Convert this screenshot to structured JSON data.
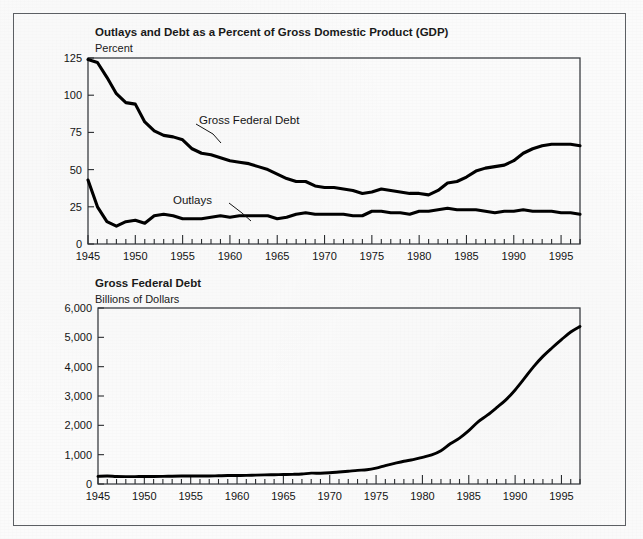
{
  "figure": {
    "background_color": "#fbfbfb",
    "frame_color": "#5c5f63",
    "line_color": "#000000"
  },
  "top_chart": {
    "title": "Outlays and Debt as a Percent of Gross Domestic Product (GDP)",
    "subtitle": "Percent",
    "label_debt": "Gross Federal Debt",
    "label_outlays": "Outlays"
  },
  "bottom_chart": {
    "title": "Gross Federal Debt",
    "subtitle": "Billions of Dollars"
  },
  "chart_data": [
    {
      "id": "outlays-and-debt-percent-gdp",
      "type": "line",
      "title": "Outlays and Debt as a Percent of Gross Domestic Product (GDP)",
      "xlabel": "",
      "ylabel": "Percent",
      "xlim": [
        1945,
        1997
      ],
      "ylim": [
        0,
        125
      ],
      "yticks": [
        0,
        25,
        50,
        75,
        100,
        125
      ],
      "ytick_labels": [
        "0",
        "25",
        "50",
        "75",
        "100",
        "125"
      ],
      "xticks": [
        1945,
        1950,
        1955,
        1960,
        1965,
        1970,
        1975,
        1980,
        1985,
        1990,
        1995
      ],
      "xtick_labels": [
        "1945",
        "1950",
        "1955",
        "1960",
        "1965",
        "1970",
        "1975",
        "1980",
        "1985",
        "1990",
        "1995"
      ],
      "minor_xtick_interval": 1,
      "grid": false,
      "legend": "inline-annotations",
      "annotations": [
        {
          "text": "Gross Federal Debt",
          "x": 1958.5,
          "y": 92
        },
        {
          "text": "Outlays",
          "x": 1955.5,
          "y": 32
        }
      ],
      "x": [
        1945,
        1946,
        1947,
        1948,
        1949,
        1950,
        1951,
        1952,
        1953,
        1954,
        1955,
        1956,
        1957,
        1958,
        1959,
        1960,
        1961,
        1962,
        1963,
        1964,
        1965,
        1966,
        1967,
        1968,
        1969,
        1970,
        1971,
        1972,
        1973,
        1974,
        1975,
        1976,
        1977,
        1978,
        1979,
        1980,
        1981,
        1982,
        1983,
        1984,
        1985,
        1986,
        1987,
        1988,
        1989,
        1990,
        1991,
        1992,
        1993,
        1994,
        1995,
        1996,
        1997
      ],
      "series": [
        {
          "name": "Gross Federal Debt",
          "values": [
            124,
            122,
            112,
            101,
            95,
            94,
            82,
            76,
            73,
            72,
            70,
            64,
            61,
            60,
            58,
            56,
            55,
            54,
            52,
            50,
            47,
            44,
            42,
            42,
            39,
            38,
            38,
            37,
            36,
            34,
            35,
            37,
            36,
            35,
            34,
            34,
            33,
            36,
            41,
            42,
            45,
            49,
            51,
            52,
            53,
            56,
            61,
            64,
            66,
            67,
            67,
            67,
            66
          ]
        },
        {
          "name": "Outlays",
          "values": [
            43,
            25,
            15,
            12,
            15,
            16,
            14,
            19,
            20,
            19,
            17,
            17,
            17,
            18,
            19,
            18,
            19,
            19,
            19,
            19,
            17,
            18,
            20,
            21,
            20,
            20,
            20,
            20,
            19,
            19,
            22,
            22,
            21,
            21,
            20,
            22,
            22,
            23,
            24,
            23,
            23,
            23,
            22,
            21,
            22,
            22,
            23,
            22,
            22,
            22,
            21,
            21,
            20
          ]
        }
      ]
    },
    {
      "id": "gross-federal-debt-billions",
      "type": "line",
      "title": "Gross Federal Debt",
      "xlabel": "",
      "ylabel": "Billions of Dollars",
      "xlim": [
        1945,
        1997
      ],
      "ylim": [
        0,
        6000
      ],
      "yticks": [
        0,
        1000,
        2000,
        3000,
        4000,
        5000,
        6000
      ],
      "ytick_labels": [
        "0",
        "1,000",
        "2,000",
        "3,000",
        "4,000",
        "5,000",
        "6,000"
      ],
      "xticks": [
        1945,
        1950,
        1955,
        1960,
        1965,
        1970,
        1975,
        1980,
        1985,
        1990,
        1995
      ],
      "xtick_labels": [
        "1945",
        "1950",
        "1955",
        "1960",
        "1965",
        "1970",
        "1975",
        "1980",
        "1985",
        "1990",
        "1995"
      ],
      "minor_xtick_interval": 1,
      "grid": false,
      "x": [
        1945,
        1946,
        1947,
        1948,
        1949,
        1950,
        1951,
        1952,
        1953,
        1954,
        1955,
        1956,
        1957,
        1958,
        1959,
        1960,
        1961,
        1962,
        1963,
        1964,
        1965,
        1966,
        1967,
        1968,
        1969,
        1970,
        1971,
        1972,
        1973,
        1974,
        1975,
        1976,
        1977,
        1978,
        1979,
        1980,
        1981,
        1982,
        1983,
        1984,
        1985,
        1986,
        1987,
        1988,
        1989,
        1990,
        1991,
        1992,
        1993,
        1994,
        1995,
        1996,
        1997
      ],
      "series": [
        {
          "name": "Gross Federal Debt",
          "values": [
            260,
            271,
            257,
            252,
            253,
            257,
            255,
            259,
            266,
            271,
            274,
            273,
            272,
            280,
            288,
            291,
            293,
            303,
            311,
            317,
            323,
            329,
            341,
            370,
            367,
            381,
            408,
            436,
            466,
            484,
            541,
            629,
            706,
            777,
            829,
            909,
            995,
            1137,
            1371,
            1565,
            1818,
            2120,
            2346,
            2601,
            2868,
            3206,
            3598,
            4002,
            4351,
            4644,
            4921,
            5181,
            5370
          ]
        }
      ]
    }
  ]
}
